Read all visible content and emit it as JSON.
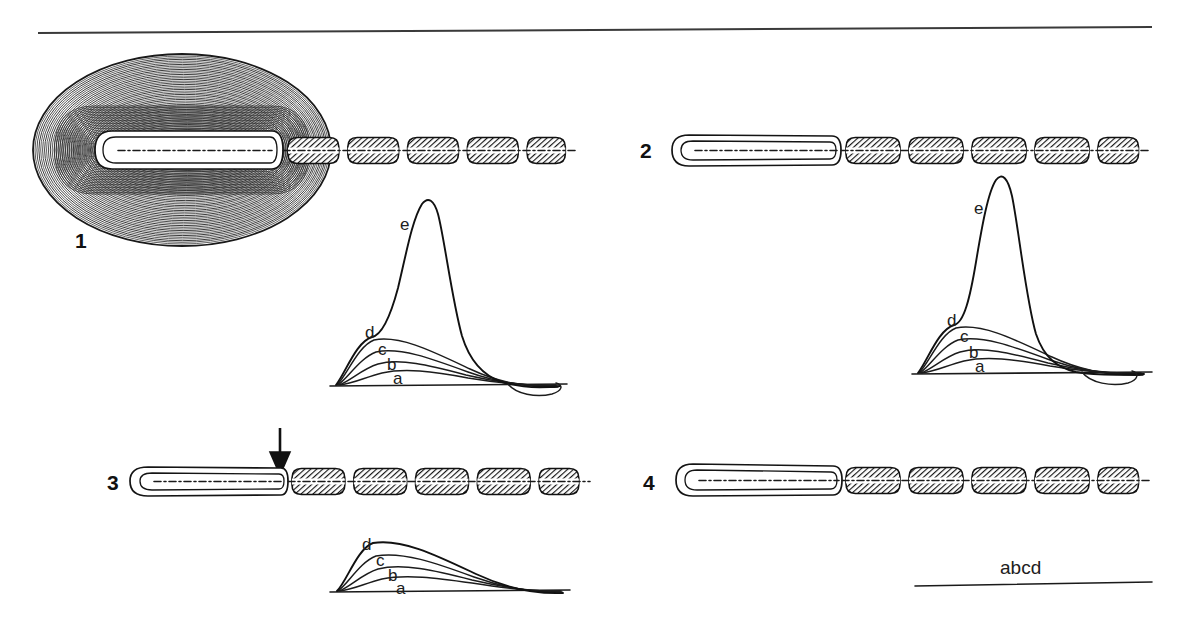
{
  "figure": {
    "top_rule": "horizontal-rule",
    "background_color": "#ffffff",
    "ink_color": "#111111"
  },
  "panels": [
    {
      "number": "1",
      "structure": "myelinated-fiber-with-tumor-mass",
      "has_mass": true,
      "has_arrow": false,
      "trace": {
        "curves": [
          "a",
          "b",
          "c",
          "d",
          "e"
        ],
        "labels": [
          "a",
          "b",
          "c",
          "d",
          "e"
        ],
        "has_spike": true,
        "has_undershoot": true
      }
    },
    {
      "number": "2",
      "structure": "myelinated-fiber-demyelinated-segment",
      "has_mass": false,
      "has_arrow": false,
      "trace": {
        "curves": [
          "a",
          "b",
          "c",
          "d",
          "e"
        ],
        "labels": [
          "a",
          "b",
          "c",
          "d",
          "e"
        ],
        "has_spike": true,
        "has_undershoot": true
      }
    },
    {
      "number": "3",
      "structure": "myelinated-fiber-block-at-junction",
      "has_mass": false,
      "has_arrow": true,
      "trace": {
        "curves": [
          "a",
          "b",
          "c",
          "d"
        ],
        "labels": [
          "a",
          "b",
          "c",
          "d"
        ],
        "has_spike": false,
        "has_undershoot": false
      }
    },
    {
      "number": "4",
      "structure": "myelinated-fiber-complete-block",
      "has_mass": false,
      "has_arrow": false,
      "trace": {
        "curves": [],
        "labels": [],
        "flat_label": "abcd",
        "has_spike": false,
        "has_undershoot": false
      }
    }
  ],
  "chart_data": [
    {
      "type": "line",
      "title": "",
      "panel": "1",
      "xlabel": "",
      "ylabel": "",
      "series": [
        {
          "name": "a",
          "peak": 12,
          "peak_x": 0.33
        },
        {
          "name": "b",
          "peak": 22,
          "peak_x": 0.31
        },
        {
          "name": "c",
          "peak": 34,
          "peak_x": 0.3
        },
        {
          "name": "d",
          "peak": 46,
          "peak_x": 0.29
        },
        {
          "name": "e",
          "peak": 175,
          "peak_x": 0.42
        }
      ],
      "legend": [
        "a",
        "b",
        "c",
        "d",
        "e"
      ],
      "grid": false
    },
    {
      "type": "line",
      "title": "",
      "panel": "2",
      "xlabel": "",
      "ylabel": "",
      "series": [
        {
          "name": "a",
          "peak": 12,
          "peak_x": 0.33
        },
        {
          "name": "b",
          "peak": 22,
          "peak_x": 0.31
        },
        {
          "name": "c",
          "peak": 34,
          "peak_x": 0.3
        },
        {
          "name": "d",
          "peak": 46,
          "peak_x": 0.29
        },
        {
          "name": "e",
          "peak": 175,
          "peak_x": 0.4
        }
      ],
      "legend": [
        "a",
        "b",
        "c",
        "d",
        "e"
      ],
      "grid": false
    },
    {
      "type": "line",
      "title": "",
      "panel": "3",
      "xlabel": "",
      "ylabel": "",
      "series": [
        {
          "name": "a",
          "peak": 12,
          "peak_x": 0.34
        },
        {
          "name": "b",
          "peak": 23,
          "peak_x": 0.32
        },
        {
          "name": "c",
          "peak": 36,
          "peak_x": 0.31
        },
        {
          "name": "d",
          "peak": 50,
          "peak_x": 0.3
        }
      ],
      "legend": [
        "a",
        "b",
        "c",
        "d"
      ],
      "grid": false
    },
    {
      "type": "line",
      "title": "",
      "panel": "4",
      "xlabel": "",
      "ylabel": "",
      "series": [
        {
          "name": "abcd",
          "peak": 0,
          "peak_x": 0
        }
      ],
      "legend": [
        "abcd"
      ],
      "grid": false
    }
  ]
}
